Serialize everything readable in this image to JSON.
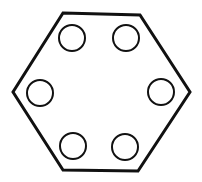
{
  "diagram": {
    "stroke_color": "#111111",
    "background": "#ffffff",
    "hexagon": {
      "points": "63,13 140,15 190,92 138,171 63,170 13,92",
      "stroke_width": 3
    },
    "holes": [
      {
        "cx": 72,
        "cy": 38,
        "r": 13
      },
      {
        "cx": 126,
        "cy": 38,
        "r": 13
      },
      {
        "cx": 40,
        "cy": 93,
        "r": 13
      },
      {
        "cx": 161,
        "cy": 92,
        "r": 13
      },
      {
        "cx": 73,
        "cy": 146,
        "r": 13
      },
      {
        "cx": 125,
        "cy": 147,
        "r": 13
      }
    ]
  }
}
